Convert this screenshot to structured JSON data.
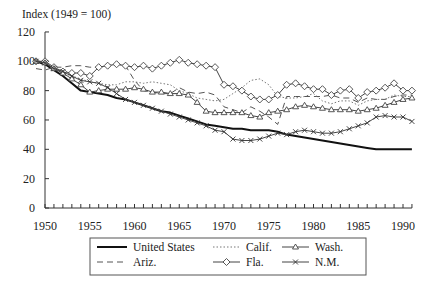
{
  "chart_data": {
    "type": "line",
    "title": "",
    "ylabel": "Index (1949 = 100)",
    "xlabel": "",
    "xlim": [
      1949,
      1991
    ],
    "ylim": [
      0,
      120
    ],
    "yticks": [
      0,
      20,
      40,
      60,
      80,
      100,
      120
    ],
    "xticks": [
      1950,
      1955,
      1960,
      1965,
      1970,
      1975,
      1980,
      1985,
      1990
    ],
    "grid": false,
    "legend_position": "bottom",
    "x": [
      1949,
      1950,
      1951,
      1952,
      1953,
      1954,
      1955,
      1956,
      1957,
      1958,
      1959,
      1960,
      1961,
      1962,
      1963,
      1964,
      1965,
      1966,
      1967,
      1968,
      1969,
      1970,
      1971,
      1972,
      1973,
      1974,
      1975,
      1976,
      1977,
      1978,
      1979,
      1980,
      1981,
      1982,
      1983,
      1984,
      1985,
      1986,
      1987,
      1988,
      1989,
      1990,
      1991
    ],
    "series": [
      {
        "name": "United States",
        "style": "solid-thick",
        "marker": "none",
        "values": [
          100,
          98,
          94,
          90,
          85,
          80,
          79,
          78,
          77,
          75,
          74,
          72,
          70,
          68,
          66,
          65,
          63,
          61,
          59,
          57,
          56,
          55,
          54,
          54,
          53,
          53,
          53,
          52,
          50,
          49,
          48,
          47,
          46,
          45,
          44,
          43,
          42,
          41,
          40,
          40,
          40,
          40,
          40
        ]
      },
      {
        "name": "Ariz.",
        "style": "dashed",
        "marker": "none",
        "values": [
          95,
          94,
          96,
          96,
          97,
          97,
          96,
          96,
          97,
          98,
          97,
          87,
          80,
          79,
          78,
          78,
          82,
          79,
          78,
          79,
          77,
          69,
          67,
          65,
          69,
          66,
          62,
          57,
          76,
          76,
          76,
          76,
          76,
          77,
          75,
          75,
          72,
          75,
          74,
          74,
          76,
          77,
          77
        ]
      },
      {
        "name": "Calif.",
        "style": "dotted",
        "marker": "none",
        "values": [
          100,
          99,
          95,
          92,
          90,
          88,
          86,
          85,
          84,
          84,
          86,
          86,
          85,
          86,
          85,
          84,
          80,
          78,
          75,
          74,
          73,
          74,
          78,
          82,
          87,
          88,
          84,
          76,
          75,
          75,
          76,
          78,
          73,
          71,
          73,
          73,
          70,
          73,
          74,
          74,
          77,
          76,
          76
        ]
      },
      {
        "name": "Fla.",
        "style": "solid",
        "marker": "diamond",
        "values": [
          100,
          100,
          96,
          93,
          92,
          92,
          90,
          96,
          97,
          98,
          97,
          96,
          97,
          95,
          97,
          99,
          101,
          99,
          98,
          97,
          96,
          84,
          83,
          80,
          76,
          74,
          74,
          77,
          84,
          85,
          83,
          81,
          81,
          77,
          80,
          81,
          75,
          79,
          80,
          82,
          85,
          80,
          80
        ]
      },
      {
        "name": "Wash.",
        "style": "solid",
        "marker": "triangle",
        "values": [
          100,
          99,
          95,
          92,
          88,
          84,
          79,
          80,
          81,
          81,
          81,
          82,
          81,
          79,
          79,
          78,
          78,
          77,
          72,
          66,
          65,
          65,
          65,
          65,
          63,
          62,
          65,
          66,
          67,
          69,
          70,
          69,
          68,
          67,
          67,
          67,
          66,
          67,
          68,
          70,
          72,
          74,
          75
        ]
      },
      {
        "name": "N.M.",
        "style": "solid",
        "marker": "x",
        "values": [
          100,
          99,
          95,
          93,
          90,
          87,
          86,
          85,
          82,
          78,
          74,
          72,
          70,
          68,
          66,
          64,
          62,
          60,
          58,
          56,
          53,
          52,
          47,
          46,
          46,
          47,
          49,
          51,
          50,
          52,
          53,
          52,
          51,
          51,
          52,
          54,
          56,
          58,
          62,
          63,
          62,
          62,
          59
        ]
      }
    ]
  },
  "legend": {
    "items": [
      {
        "label": "United States",
        "key": "us"
      },
      {
        "label": "Calif.",
        "key": "ca"
      },
      {
        "label": "Wash.",
        "key": "wa"
      },
      {
        "label": "Ariz.",
        "key": "az"
      },
      {
        "label": "Fla.",
        "key": "fl"
      },
      {
        "label": "N.M.",
        "key": "nm"
      }
    ]
  }
}
